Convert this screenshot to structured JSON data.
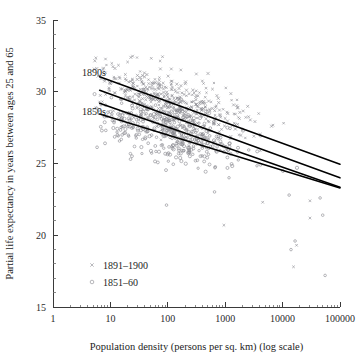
{
  "chart_data": {
    "type": "scatter",
    "title": "",
    "xlabel": "Population density (persons per sq. km) (log scale)",
    "ylabel": "Partial life expectancy in years between ages 25 and 65",
    "xscale": "log",
    "yscale": "linear",
    "xlim": [
      1,
      100000
    ],
    "ylim": [
      15,
      35
    ],
    "grid": false,
    "legend_position": "inside-lower-left",
    "xticks": [
      "1",
      "10",
      "100",
      "1000",
      "10000",
      "100000"
    ],
    "xtick_values": [
      1,
      10,
      100,
      1000,
      10000,
      100000
    ],
    "yticks": [
      "35",
      "30",
      "25",
      "20",
      "15"
    ],
    "ytick_values": [
      35,
      30,
      25,
      20,
      15
    ],
    "ytick_minor_values": [
      34,
      33,
      32,
      31,
      29,
      28,
      27,
      26,
      24,
      23,
      22,
      21,
      19,
      18,
      17,
      16
    ],
    "annotations": [
      {
        "text": "1890s",
        "x": 3.2,
        "y": 31.1
      },
      {
        "text": "1850s",
        "x": 3.2,
        "y": 28.4
      }
    ],
    "legend": [
      {
        "label": "1891–1900",
        "marker": "cross",
        "color": "#8d8d93"
      },
      {
        "label": "1851–60",
        "marker": "circle",
        "color": "#8a8a90"
      }
    ],
    "series": [
      {
        "name": "1891–1900",
        "marker": "cross",
        "color": "#8d8d93",
        "n_points": 470,
        "cluster": {
          "x_log_mean": 2.05,
          "x_log_sd": 0.62,
          "y_mean": 29.35,
          "y_sd": 1.25
        }
      },
      {
        "name": "1851–60",
        "marker": "circle",
        "color": "#8a8a90",
        "n_points": 430,
        "cluster": {
          "x_log_mean": 2.0,
          "x_log_sd": 0.63,
          "y_mean": 27.0,
          "y_sd": 1.35
        }
      }
    ],
    "fit_lines": [
      {
        "name": "1890s-upper",
        "x_start": 6.5,
        "y_start": 31.05,
        "x_end": 100000,
        "y_end": 24.95
      },
      {
        "name": "1890s-lower",
        "x_start": 6.5,
        "y_start": 30.1,
        "x_end": 100000,
        "y_end": 24.0
      },
      {
        "name": "1850s-upper",
        "x_start": 6.5,
        "y_start": 29.2,
        "x_end": 100000,
        "y_end": 23.35
      },
      {
        "name": "1850s-lower",
        "x_start": 6.5,
        "y_start": 28.45,
        "x_end": 100000,
        "y_end": 23.3
      }
    ]
  }
}
